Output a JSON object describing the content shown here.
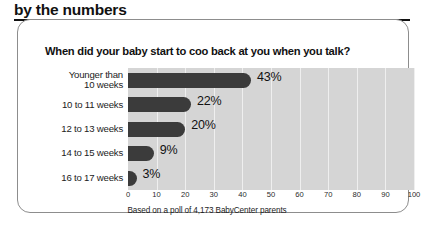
{
  "header": {
    "section_heading": "by the numbers"
  },
  "card": {
    "question": "When did your baby start to coo back at you when you talk?",
    "source_note": "Based on a poll of 4,173 BabyCenter parents"
  },
  "colors": {
    "bar": "#3b3b3b",
    "plot_background": "#d5d5d5",
    "gridline": "#efefef",
    "card_border": "#8d8d8d",
    "text": "#111111"
  },
  "chart_data": {
    "type": "bar",
    "orientation": "horizontal",
    "title": "When did your baby start to coo back at you when you talk?",
    "subtitle": "",
    "xlabel": "",
    "ylabel": "",
    "xlim": [
      0,
      100
    ],
    "xticks": [
      0,
      10,
      20,
      30,
      40,
      50,
      60,
      70,
      80,
      90,
      100
    ],
    "grid": true,
    "legend": false,
    "annotation": "Based on a poll of 4,173 BabyCenter parents",
    "categories": [
      "Younger than\n10 weeks",
      "10 to 11 weeks",
      "12 to 13 weeks",
      "14 to 15 weeks",
      "16 to 17 weeks"
    ],
    "values": [
      43,
      22,
      20,
      9,
      3
    ],
    "value_labels": [
      "43%",
      "22%",
      "20%",
      "9%",
      "3%"
    ]
  }
}
